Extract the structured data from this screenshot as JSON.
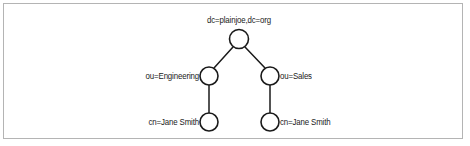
{
  "figure": {
    "type": "ldap-directory-tree-diagram",
    "border_color": "#b4b4b4",
    "background_color": "#ffffff",
    "node_stroke_color": "#1a1a1a",
    "node_fill_color": "#ffffff",
    "edge_color": "#1a1a1a",
    "text_color": "#1a1a1a"
  },
  "nodes": {
    "root": {
      "label": "dc=plainjoe,dc=org",
      "cx": 239,
      "cy": 39,
      "r": 9.5,
      "label_position": "above"
    },
    "engineering": {
      "label": "ou=Engineering",
      "cx": 209,
      "cy": 76,
      "r": 9,
      "label_position": "left"
    },
    "sales": {
      "label": "ou=Sales",
      "cx": 270,
      "cy": 76,
      "r": 9,
      "label_position": "right"
    },
    "jane_engineering": {
      "label": "cn=Jane Smith",
      "cx": 209,
      "cy": 122,
      "r": 9,
      "label_position": "left"
    },
    "jane_sales": {
      "label": "cn=Jane Smith",
      "cx": 270,
      "cy": 122,
      "r": 9,
      "label_position": "right"
    }
  },
  "edges": [
    {
      "from": "root",
      "to": "engineering"
    },
    {
      "from": "root",
      "to": "sales"
    },
    {
      "from": "engineering",
      "to": "jane_engineering"
    },
    {
      "from": "sales",
      "to": "jane_sales"
    }
  ]
}
